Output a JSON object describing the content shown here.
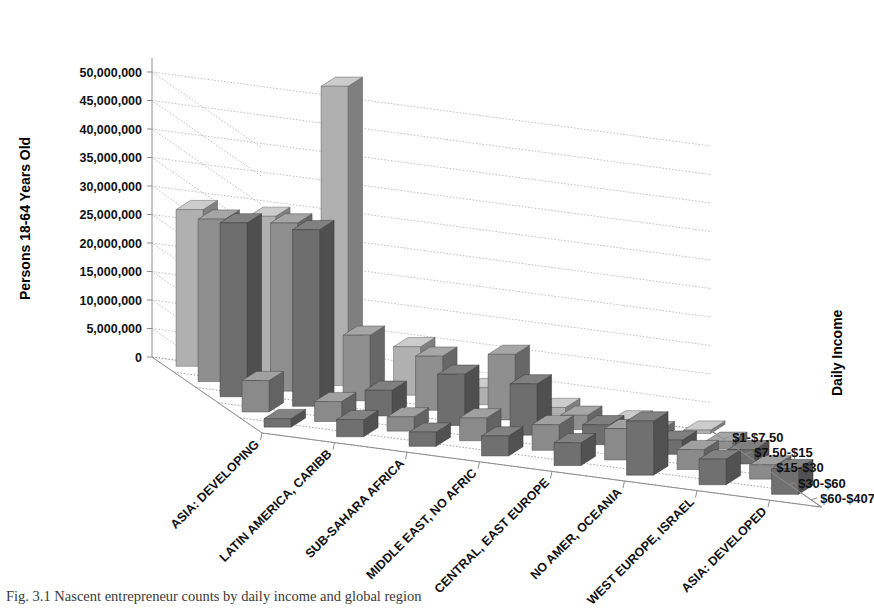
{
  "figure": {
    "caption": "Fig. 3.1 Nascent entrepreneur counts by daily income and global region"
  },
  "axes": {
    "y_title": "Persons 18-64 Years Old",
    "z_title": "Daily Income"
  },
  "chart_data": {
    "type": "bar",
    "title": "",
    "subtitle": "",
    "xlabel": "",
    "ylabel": "Persons 18-64 Years Old",
    "zlabel": "Daily Income",
    "ylim": [
      0,
      50000000
    ],
    "grid": true,
    "legend_position": "right",
    "projection": "3d",
    "ytick_labels": [
      "0",
      "5,000,000",
      "10,000,000",
      "15,000,000",
      "20,000,000",
      "25,000,000",
      "30,000,000",
      "35,000,000",
      "40,000,000",
      "45,000,000",
      "50,000,000"
    ],
    "ytick_values": [
      0,
      5000000,
      10000000,
      15000000,
      20000000,
      25000000,
      30000000,
      35000000,
      40000000,
      45000000,
      50000000
    ],
    "categories": [
      "ASIA: DEVELOPING",
      "LATIN AMERICA, CARIBB",
      "SUB-SAHARA AFRICA",
      "MIDDLE EAST, NO AFRIC",
      "CENTRAL, EAST EUROPE",
      "NO AMER, OCEANIA",
      "WEST EUROPE, ISRAEL",
      "ASIA: DEVELOPED"
    ],
    "series": [
      {
        "name": "$1-$7.50",
        "color": "#b0b0b0",
        "values": [
          27500000,
          28000000,
          52500000,
          8500000,
          3000000,
          1200000,
          700000,
          600000
        ]
      },
      {
        "name": "$7.50-$15",
        "color": "#8f8f8f",
        "values": [
          28500000,
          29500000,
          11500000,
          9500000,
          11500000,
          2500000,
          1500000,
          1300000
        ]
      },
      {
        "name": "$15-$30",
        "color": "#6e6e6e",
        "values": [
          30500000,
          31000000,
          4500000,
          9000000,
          9000000,
          3500000,
          2500000,
          2500000
        ]
      },
      {
        "name": "$30-$60",
        "color": "#8a8a8a",
        "values": [
          5500000,
          3500000,
          2500000,
          4000000,
          4500000,
          5500000,
          3500000,
          2500000
        ]
      },
      {
        "name": "$60-$407",
        "color": "#707070",
        "values": [
          1500000,
          3000000,
          2500000,
          3500000,
          4000000,
          9500000,
          4500000,
          4500000
        ]
      }
    ]
  }
}
